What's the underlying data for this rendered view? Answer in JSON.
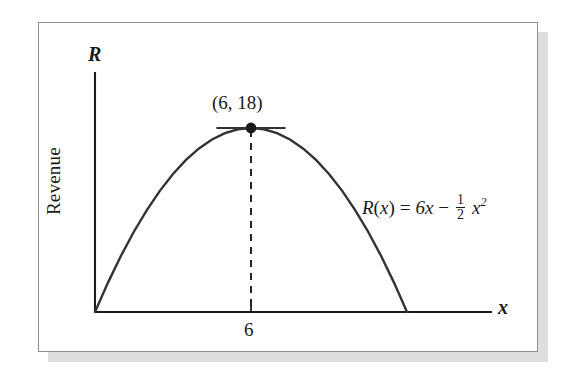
{
  "figure": {
    "background_color": "#ffffff",
    "frame_border_color": "#8d8d8d",
    "shadow_color": "#d8d8d8",
    "curve_color": "#333333",
    "axis_color": "#1a1a1a"
  },
  "labels": {
    "y_axis_symbol": "R",
    "x_axis_symbol": "x",
    "y_axis_title": "Revenue",
    "vertex_point": "(6, 18)",
    "x_tick": "6"
  },
  "equation": {
    "fn_name": "R",
    "open_paren": "(",
    "variable": "x",
    "close_paren": ")",
    "equals": "=",
    "term1": "6x",
    "minus": "−",
    "frac_numerator": "1",
    "frac_denominator": "2",
    "term2_base": "x",
    "term2_exponent": "2",
    "full_text": "R(x) = 6x − 1/2 x²"
  },
  "chart_data": {
    "type": "line",
    "title": "",
    "subtitle": "",
    "xlabel": "x",
    "ylabel": "Revenue",
    "function": "R(x) = 6x - (1/2)x^2",
    "grid": false,
    "legend": null,
    "xlim": [
      0,
      14
    ],
    "ylim": [
      0,
      21
    ],
    "x_ticks": [
      6
    ],
    "x_tick_labels": [
      "6"
    ],
    "y_ticks": [],
    "y_tick_labels": [],
    "series": [
      {
        "name": "R(x)",
        "color": "#333333",
        "style": "solid",
        "x": [
          0,
          0.5,
          1,
          1.5,
          2,
          2.5,
          3,
          3.5,
          4,
          4.5,
          5,
          5.5,
          6,
          6.5,
          7,
          7.5,
          8,
          8.5,
          9,
          9.5,
          10,
          10.5,
          11,
          11.5,
          12
        ],
        "y": [
          0,
          2.875,
          5.5,
          7.875,
          10,
          11.875,
          13.5,
          14.875,
          16,
          16.875,
          17.5,
          17.875,
          18,
          17.875,
          17.5,
          16.875,
          16,
          14.875,
          13.5,
          11.875,
          10,
          7.875,
          5.5,
          2.875,
          0
        ]
      }
    ],
    "annotations": [
      {
        "kind": "point",
        "label": "(6, 18)",
        "x": 6,
        "y": 18,
        "marker": "filled-circle",
        "color": "#1a1a1a"
      },
      {
        "kind": "tangent-line",
        "label": "",
        "x_from": 4.7,
        "x_to": 7.3,
        "y": 18,
        "style": "solid",
        "color": "#333333"
      },
      {
        "kind": "dropline",
        "label": "",
        "x": 6,
        "y_from": 0,
        "y_to": 18,
        "style": "dashed",
        "color": "#1a1a1a"
      },
      {
        "kind": "text",
        "label": "R(x) = 6x − 1/2 x²",
        "x": 10.2,
        "y": 9.0
      }
    ]
  }
}
